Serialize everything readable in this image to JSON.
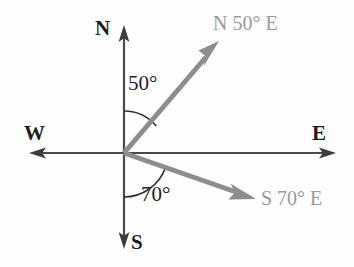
{
  "diagram": {
    "type": "compass-bearing",
    "background_color": "#fefefe",
    "origin": {
      "x": 124,
      "y": 153
    },
    "colors": {
      "axis": "#4a4a4a",
      "ray": "#8d8d8d",
      "arc": "#3a3a3a",
      "cardinal_text": "#1c1c1c",
      "angle_text": "#242424",
      "bearing_text": "#9a9a9a"
    },
    "cardinals": {
      "north": "N",
      "south": "S",
      "east": "E",
      "west": "W"
    },
    "angles": {
      "from_north": "50°",
      "from_south": "70°"
    },
    "bearings": {
      "north_east": "N 50° E",
      "south_east": "S 70° E"
    },
    "axes": [
      {
        "name": "north-axis",
        "from": {
          "x": 124,
          "y": 153
        },
        "to": {
          "x": 124,
          "y": 26
        }
      },
      {
        "name": "south-axis",
        "from": {
          "x": 124,
          "y": 153
        },
        "to": {
          "x": 124,
          "y": 248
        }
      },
      {
        "name": "east-axis",
        "from": {
          "x": 124,
          "y": 153
        },
        "to": {
          "x": 335,
          "y": 153
        }
      },
      {
        "name": "west-axis",
        "from": {
          "x": 124,
          "y": 153
        },
        "to": {
          "x": 30,
          "y": 153
        }
      }
    ],
    "rays": [
      {
        "name": "bearing-ray-n50e",
        "label": "N 50° E",
        "angle_from_north_deg": 50,
        "from": {
          "x": 124,
          "y": 153
        },
        "to": {
          "x": 218,
          "y": 43
        }
      },
      {
        "name": "bearing-ray-s70e",
        "label": "S 70° E",
        "angle_from_south_deg": 70,
        "from": {
          "x": 124,
          "y": 153
        },
        "to": {
          "x": 254,
          "y": 199
        }
      }
    ],
    "arcs": [
      {
        "name": "angle-arc-50",
        "value": "50°",
        "radius": 42,
        "start_deg": 90,
        "end_deg": 40
      },
      {
        "name": "angle-arc-70",
        "value": "70°",
        "radius": 44,
        "start_deg": 270,
        "end_deg": 340
      }
    ]
  }
}
